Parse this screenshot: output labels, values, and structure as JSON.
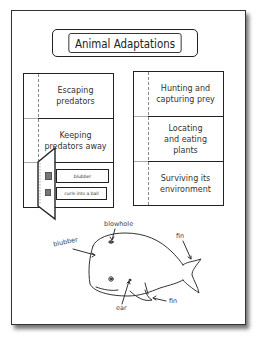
{
  "title": "Animal Adaptations",
  "left_column": {
    "rows": [
      {
        "label": "Escaping predators"
      },
      {
        "label": "Keeping predators away"
      },
      {
        "label": ""
      }
    ],
    "flap_tabs": [
      {
        "label": "blubber",
        "icon": "whale-thumbnail-icon"
      },
      {
        "label": "curls into a ball",
        "icon": "armadillo-thumbnail-icon"
      }
    ]
  },
  "right_column": {
    "rows": [
      {
        "label": "Hunting and capturing prey"
      },
      {
        "label": "Locating and eating plants"
      },
      {
        "label": "Surviving its environment"
      }
    ]
  },
  "diagram": {
    "labels": {
      "blubber": "blubber",
      "blowhole": "blowhole",
      "fin_tail": "fin",
      "fin_flipper": "fin",
      "ear": "ear"
    }
  }
}
